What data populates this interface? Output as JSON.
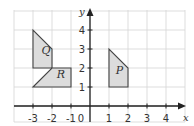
{
  "diagram": {
    "type": "coordinate-grid",
    "x_axis": {
      "label": "x",
      "range": [
        -4,
        5
      ],
      "tick_labels": [
        "-3",
        "-2",
        "-1",
        "0",
        "1",
        "2",
        "3",
        "4"
      ]
    },
    "y_axis": {
      "label": "y",
      "range": [
        0,
        5
      ],
      "tick_labels": [
        "1",
        "2",
        "3",
        "4"
      ]
    },
    "shapes": [
      {
        "name": "Q",
        "vertices": [
          [
            -3,
            2
          ],
          [
            -3,
            4
          ],
          [
            -2,
            3
          ],
          [
            -2,
            2
          ]
        ],
        "label_pos": [
          -2.55,
          2.75
        ]
      },
      {
        "name": "R",
        "vertices": [
          [
            -3,
            1
          ],
          [
            -2,
            2
          ],
          [
            -1,
            2
          ],
          [
            -1,
            1
          ]
        ],
        "label_pos": [
          -1.75,
          1.5
        ]
      },
      {
        "name": "P",
        "vertices": [
          [
            1,
            1
          ],
          [
            1,
            3
          ],
          [
            2,
            2
          ],
          [
            2,
            1
          ]
        ],
        "label_pos": [
          1.35,
          1.7
        ]
      }
    ],
    "colors": {
      "shape_fill": "#dcdcdc",
      "shape_stroke": "#444444",
      "grid": "#d4d4d4",
      "axis": "#222222"
    }
  }
}
